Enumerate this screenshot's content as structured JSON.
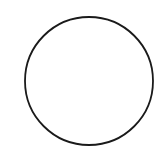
{
  "diagram": {
    "type": "shape",
    "shapes": [
      {
        "kind": "circle",
        "label": "",
        "cx": 89,
        "cy": 81,
        "r": 64,
        "stroke": "#1a1a1a",
        "stroke_width": 1.8,
        "fill": "none"
      }
    ],
    "background": "#ffffff"
  }
}
